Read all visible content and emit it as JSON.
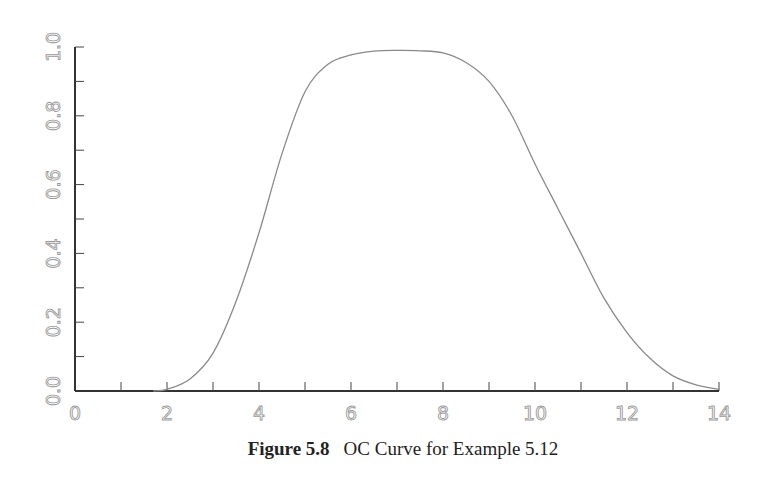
{
  "caption": {
    "figure_number": "Figure 5.8",
    "title": "OC Curve for Example 5.12"
  },
  "chart_data": {
    "type": "line",
    "title": "OC Curve for Example 5.12",
    "xlabel": "",
    "ylabel": "",
    "xlim": [
      0,
      14
    ],
    "ylim": [
      0.0,
      1.0
    ],
    "x_ticks": [
      "0",
      "2",
      "4",
      "6",
      "8",
      "10",
      "12",
      "14"
    ],
    "x_minor_step": 1,
    "y_ticks": [
      "0.0",
      "0.2",
      "0.4",
      "0.6",
      "0.8",
      "1.0"
    ],
    "y_minor_step": 0.1,
    "grid": false,
    "legend": null,
    "series": [
      {
        "name": "OC curve",
        "color": "#8a8a8a",
        "x": [
          1.7,
          2,
          2.5,
          3,
          3.5,
          4,
          4.5,
          5,
          5.5,
          6,
          6.5,
          7,
          7.5,
          8,
          8.5,
          9,
          9.5,
          10,
          10.5,
          11,
          11.5,
          12,
          12.5,
          13,
          13.5,
          14
        ],
        "y": [
          0.0,
          0.005,
          0.035,
          0.11,
          0.26,
          0.46,
          0.69,
          0.87,
          0.95,
          0.977,
          0.988,
          0.99,
          0.989,
          0.983,
          0.955,
          0.9,
          0.8,
          0.66,
          0.53,
          0.4,
          0.27,
          0.17,
          0.095,
          0.044,
          0.018,
          0.005
        ]
      }
    ]
  }
}
